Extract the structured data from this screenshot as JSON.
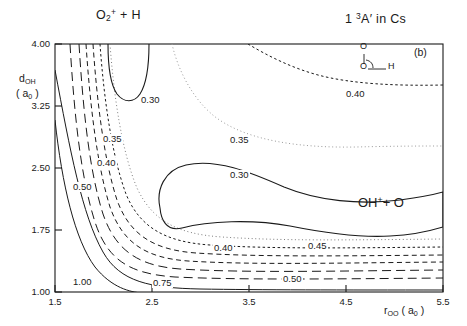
{
  "figure": {
    "panel_label": "(b)",
    "reactant_label": "O₂⁺ + H",
    "product_label": "OH⁺+ O",
    "state_label": "1 ³A′ in Cs",
    "inset": {
      "atom_top": "O",
      "atom_bottom": "O",
      "atom_right": "H",
      "name": "molecular-geometry-inset"
    },
    "ink_color": "#1a1a1a",
    "background_color": "#ffffff"
  },
  "chart_data": {
    "type": "contour",
    "title": "",
    "subtitle": "",
    "xlabel": "rₒₒ (a₀)",
    "ylabel": "dₒₕ (a₀)",
    "xlabel_parts": {
      "base": "r",
      "sub": "OO",
      "units": "(a",
      "units_sub": "0",
      "units_end": ")"
    },
    "ylabel_parts": {
      "base": "d",
      "sub": "OH",
      "units": "(a",
      "units_sub": "0",
      "units_end": ")"
    },
    "xlim": [
      1.5,
      5.5
    ],
    "ylim": [
      1.0,
      4.0
    ],
    "xticks": [
      "1.5",
      "2.5",
      "3.5",
      "4.5",
      "5.5"
    ],
    "xtick_values": [
      1.5,
      2.5,
      3.5,
      4.5,
      5.5
    ],
    "yticks": [
      "4.00",
      "3.25",
      "2.50",
      "1.75",
      "1.00"
    ],
    "ytick_values": [
      4.0,
      3.25,
      2.5,
      1.75,
      1.0
    ],
    "grid": false,
    "legend": "none",
    "levels": [
      0.3,
      0.35,
      0.4,
      0.45,
      0.5,
      0.75,
      1.0
    ],
    "level_styles": {
      "0.30": "solid",
      "0.35": "dotted-light",
      "0.40": "dotted-fine",
      "0.45": "dashed-short",
      "0.50": "dashed-medium",
      "0.75": "dashed-long",
      "1.00": "solid"
    },
    "contour_labels": [
      {
        "value": "0.30",
        "x": 140,
        "y": 95
      },
      {
        "value": "0.35",
        "x": 102,
        "y": 134
      },
      {
        "value": "0.40",
        "x": 96,
        "y": 158
      },
      {
        "value": "0.50",
        "x": 72,
        "y": 182
      },
      {
        "value": "0.35",
        "x": 229,
        "y": 135
      },
      {
        "value": "0.40",
        "x": 345,
        "y": 89
      },
      {
        "value": "0.30",
        "x": 229,
        "y": 170
      },
      {
        "value": "0.40",
        "x": 213,
        "y": 243
      },
      {
        "value": "0.45",
        "x": 307,
        "y": 241
      },
      {
        "value": "0.50",
        "x": 282,
        "y": 274
      },
      {
        "value": "0.75",
        "x": 152,
        "y": 278
      },
      {
        "value": "1.00",
        "x": 72,
        "y": 277
      }
    ]
  }
}
